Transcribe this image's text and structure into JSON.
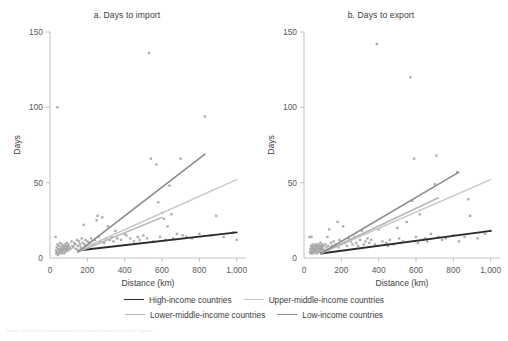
{
  "figure": {
    "source_note": "Source: World Bank calculations based on Doing Business 2016 data; Logistics.",
    "legend": {
      "rows": [
        [
          {
            "label": "High-income countries",
            "color": "#2b2b2b",
            "width": 1.9
          },
          {
            "label": "Upper-middle-income countries",
            "color": "#c8c8c8",
            "width": 1.5
          }
        ],
        [
          {
            "label": "Lower-middle-income countries",
            "color": "#b4b4b4",
            "width": 1.5
          },
          {
            "label": "Low-income countries",
            "color": "#8c8c8c",
            "width": 1.6
          }
        ]
      ]
    }
  },
  "chart_data": [
    {
      "type": "scatter",
      "panel_id": "a",
      "title": "a. Days to import",
      "xlabel": "Distance (km)",
      "ylabel": "Days",
      "xlim": [
        0,
        1050
      ],
      "ylim": [
        0,
        150
      ],
      "xticks": [
        0,
        200,
        400,
        600,
        800,
        1000
      ],
      "xticklabels": [
        "0",
        "200",
        "400",
        "600",
        "800",
        "1,000"
      ],
      "yticks": [
        0,
        50,
        100,
        150
      ],
      "yticklabels": [
        "0",
        "50",
        "100",
        "150"
      ],
      "grid": false,
      "legend_position": "bottom",
      "point_color": "#a0a0a0",
      "points": [
        [
          30,
          14
        ],
        [
          32,
          5
        ],
        [
          34,
          3
        ],
        [
          36,
          7
        ],
        [
          38,
          4
        ],
        [
          40,
          9
        ],
        [
          42,
          2
        ],
        [
          44,
          6
        ],
        [
          46,
          3
        ],
        [
          48,
          8
        ],
        [
          50,
          5
        ],
        [
          52,
          4
        ],
        [
          54,
          10
        ],
        [
          56,
          6
        ],
        [
          58,
          3
        ],
        [
          60,
          7
        ],
        [
          62,
          5
        ],
        [
          64,
          9
        ],
        [
          66,
          4
        ],
        [
          68,
          6
        ],
        [
          70,
          8
        ],
        [
          72,
          5
        ],
        [
          74,
          3
        ],
        [
          76,
          7
        ],
        [
          78,
          6
        ],
        [
          80,
          9
        ],
        [
          82,
          4
        ],
        [
          84,
          8
        ],
        [
          86,
          6
        ],
        [
          88,
          5
        ],
        [
          90,
          10
        ],
        [
          92,
          7
        ],
        [
          94,
          6
        ],
        [
          96,
          8
        ],
        [
          98,
          5
        ],
        [
          100,
          9
        ],
        [
          105,
          7
        ],
        [
          110,
          6
        ],
        [
          115,
          11
        ],
        [
          120,
          8
        ],
        [
          125,
          7
        ],
        [
          130,
          10
        ],
        [
          135,
          9
        ],
        [
          140,
          6
        ],
        [
          145,
          12
        ],
        [
          150,
          8
        ],
        [
          155,
          11
        ],
        [
          160,
          9
        ],
        [
          165,
          7
        ],
        [
          170,
          13
        ],
        [
          175,
          10
        ],
        [
          180,
          22
        ],
        [
          185,
          9
        ],
        [
          190,
          12
        ],
        [
          195,
          8
        ],
        [
          200,
          11
        ],
        [
          210,
          10
        ],
        [
          220,
          13
        ],
        [
          230,
          9
        ],
        [
          240,
          12
        ],
        [
          250,
          25
        ],
        [
          255,
          28
        ],
        [
          260,
          14
        ],
        [
          270,
          11
        ],
        [
          280,
          27
        ],
        [
          290,
          10
        ],
        [
          300,
          13
        ],
        [
          310,
          21
        ],
        [
          320,
          12
        ],
        [
          330,
          14
        ],
        [
          340,
          11
        ],
        [
          350,
          18
        ],
        [
          360,
          13
        ],
        [
          380,
          12
        ],
        [
          400,
          16
        ],
        [
          410,
          15
        ],
        [
          430,
          13
        ],
        [
          450,
          11
        ],
        [
          470,
          14
        ],
        [
          480,
          12
        ],
        [
          500,
          15
        ],
        [
          520,
          13
        ],
        [
          530,
          136
        ],
        [
          540,
          66
        ],
        [
          555,
          11
        ],
        [
          570,
          62
        ],
        [
          580,
          37
        ],
        [
          590,
          14
        ],
        [
          600,
          30
        ],
        [
          610,
          26
        ],
        [
          620,
          12
        ],
        [
          630,
          21
        ],
        [
          640,
          48
        ],
        [
          650,
          29
        ],
        [
          660,
          13
        ],
        [
          680,
          16
        ],
        [
          700,
          66
        ],
        [
          710,
          15
        ],
        [
          730,
          14
        ],
        [
          760,
          13
        ],
        [
          800,
          16
        ],
        [
          830,
          94
        ],
        [
          860,
          15
        ],
        [
          890,
          28
        ],
        [
          930,
          14
        ],
        [
          980,
          17
        ],
        [
          1000,
          12
        ],
        [
          40,
          100
        ]
      ],
      "trend_lines": [
        {
          "name": "High-income countries",
          "color": "#2b2b2b",
          "width": 1.9,
          "x0": 150,
          "y0": 5,
          "x1": 1000,
          "y1": 17
        },
        {
          "name": "Upper-middle-income countries",
          "color": "#c8c8c8",
          "width": 1.5,
          "x0": 150,
          "y0": 5,
          "x1": 1000,
          "y1": 52
        },
        {
          "name": "Lower-middle-income countries",
          "color": "#b4b4b4",
          "width": 1.5,
          "x0": 150,
          "y0": 4,
          "x1": 600,
          "y1": 27
        },
        {
          "name": "Low-income countries",
          "color": "#8c8c8c",
          "width": 1.6,
          "x0": 150,
          "y0": 4,
          "x1": 830,
          "y1": 69
        }
      ]
    },
    {
      "type": "scatter",
      "panel_id": "b",
      "title": "b. Days to export",
      "xlabel": "Distance (km)",
      "ylabel": "Days",
      "xlim": [
        0,
        1050
      ],
      "ylim": [
        0,
        150
      ],
      "xticks": [
        0,
        200,
        400,
        600,
        800,
        1000
      ],
      "xticklabels": [
        "0",
        "200",
        "400",
        "600",
        "800",
        "1,000"
      ],
      "yticks": [
        0,
        50,
        100,
        150
      ],
      "yticklabels": [
        "0",
        "50",
        "100",
        "150"
      ],
      "grid": false,
      "legend_position": "bottom",
      "point_color": "#a0a0a0",
      "points": [
        [
          30,
          14
        ],
        [
          32,
          4
        ],
        [
          34,
          6
        ],
        [
          36,
          3
        ],
        [
          38,
          8
        ],
        [
          40,
          5
        ],
        [
          42,
          7
        ],
        [
          44,
          4
        ],
        [
          46,
          9
        ],
        [
          48,
          6
        ],
        [
          50,
          3
        ],
        [
          52,
          8
        ],
        [
          54,
          5
        ],
        [
          56,
          7
        ],
        [
          58,
          4
        ],
        [
          60,
          6
        ],
        [
          62,
          9
        ],
        [
          64,
          5
        ],
        [
          66,
          8
        ],
        [
          68,
          3
        ],
        [
          70,
          7
        ],
        [
          72,
          6
        ],
        [
          74,
          4
        ],
        [
          76,
          9
        ],
        [
          78,
          5
        ],
        [
          80,
          8
        ],
        [
          82,
          6
        ],
        [
          84,
          7
        ],
        [
          86,
          4
        ],
        [
          88,
          10
        ],
        [
          90,
          6
        ],
        [
          92,
          8
        ],
        [
          94,
          5
        ],
        [
          96,
          7
        ],
        [
          98,
          9
        ],
        [
          100,
          6
        ],
        [
          105,
          8
        ],
        [
          110,
          5
        ],
        [
          115,
          9
        ],
        [
          120,
          7
        ],
        [
          125,
          14
        ],
        [
          130,
          8
        ],
        [
          135,
          19
        ],
        [
          140,
          6
        ],
        [
          145,
          10
        ],
        [
          150,
          8
        ],
        [
          160,
          11
        ],
        [
          170,
          9
        ],
        [
          180,
          24
        ],
        [
          185,
          7
        ],
        [
          190,
          12
        ],
        [
          200,
          9
        ],
        [
          210,
          21
        ],
        [
          220,
          10
        ],
        [
          230,
          8
        ],
        [
          240,
          13
        ],
        [
          250,
          11
        ],
        [
          260,
          9
        ],
        [
          270,
          14
        ],
        [
          280,
          10
        ],
        [
          290,
          8
        ],
        [
          300,
          12
        ],
        [
          310,
          18
        ],
        [
          320,
          9
        ],
        [
          330,
          11
        ],
        [
          340,
          13
        ],
        [
          350,
          10
        ],
        [
          360,
          12
        ],
        [
          380,
          9
        ],
        [
          390,
          142
        ],
        [
          400,
          19
        ],
        [
          420,
          11
        ],
        [
          440,
          10
        ],
        [
          450,
          8
        ],
        [
          460,
          12
        ],
        [
          480,
          9
        ],
        [
          500,
          20
        ],
        [
          510,
          13
        ],
        [
          530,
          11
        ],
        [
          550,
          24
        ],
        [
          570,
          120
        ],
        [
          580,
          38
        ],
        [
          590,
          66
        ],
        [
          600,
          14
        ],
        [
          610,
          10
        ],
        [
          620,
          29
        ],
        [
          640,
          12
        ],
        [
          650,
          13
        ],
        [
          660,
          11
        ],
        [
          680,
          16
        ],
        [
          700,
          49
        ],
        [
          710,
          68
        ],
        [
          720,
          14
        ],
        [
          740,
          12
        ],
        [
          760,
          13
        ],
        [
          800,
          15
        ],
        [
          820,
          57
        ],
        [
          830,
          11
        ],
        [
          860,
          14
        ],
        [
          880,
          39
        ],
        [
          890,
          28
        ],
        [
          930,
          13
        ],
        [
          970,
          16
        ],
        [
          1000,
          18
        ],
        [
          40,
          14
        ]
      ],
      "trend_lines": [
        {
          "name": "High-income countries",
          "color": "#2b2b2b",
          "width": 1.9,
          "x0": 90,
          "y0": 3,
          "x1": 1000,
          "y1": 18
        },
        {
          "name": "Upper-middle-income countries",
          "color": "#c8c8c8",
          "width": 1.5,
          "x0": 90,
          "y0": 3,
          "x1": 1000,
          "y1": 52
        },
        {
          "name": "Lower-middle-income countries",
          "color": "#b4b4b4",
          "width": 1.5,
          "x0": 90,
          "y0": 3,
          "x1": 720,
          "y1": 40
        },
        {
          "name": "Low-income countries",
          "color": "#8c8c8c",
          "width": 1.6,
          "x0": 90,
          "y0": 3,
          "x1": 830,
          "y1": 57
        }
      ]
    }
  ]
}
